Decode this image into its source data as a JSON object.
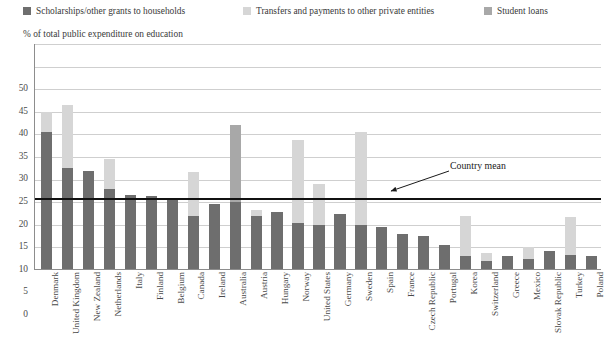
{
  "legend": {
    "items": [
      {
        "label": "Scholarships/other grants to households",
        "color": "#6e6e6e",
        "icon": "square-swatch-icon"
      },
      {
        "label": "Transfers and payments to other private entities",
        "color": "#d6d6d6",
        "icon": "square-swatch-icon"
      },
      {
        "label": "Student loans",
        "color": "#a8a8a8",
        "icon": "square-swatch-icon"
      }
    ]
  },
  "axis_title": "% of total public expenditure on education",
  "annotation": {
    "label": "Country mean",
    "value": 15.7
  },
  "chart_data": {
    "type": "bar",
    "title": "",
    "subtitle": "",
    "xlabel": "",
    "ylabel": "% of total public expenditure on education",
    "ylim": [
      0,
      50
    ],
    "yticks": [
      0,
      5,
      10,
      15,
      20,
      25,
      30,
      35,
      40,
      45,
      50
    ],
    "grid": true,
    "stacked": true,
    "legend_position": "top",
    "categories": [
      "Denmark",
      "United Kingdom",
      "New Zealand",
      "Netherlands",
      "Italy",
      "Finland",
      "Belgium",
      "Canada",
      "Ireland",
      "Australia",
      "Austria",
      "Hungary",
      "Norway",
      "United States",
      "Germany",
      "Sweden",
      "Spain",
      "France",
      "Czech Republic",
      "Portugal",
      "Korea",
      "Switzerland",
      "Greece",
      "Mexico",
      "Slovak Republic",
      "Turkey",
      "Poland"
    ],
    "series": [
      {
        "name": "Scholarships/other grants to households",
        "color": "#6e6e6e",
        "values": [
          30.5,
          22.5,
          22.0,
          18.0,
          16.5,
          16.3,
          16.0,
          12.0,
          14.7,
          15.0,
          12.0,
          12.8,
          10.5,
          10.0,
          12.3,
          10.0,
          9.5,
          8.0,
          7.5,
          5.5,
          3.0,
          2.0,
          3.2,
          2.5,
          4.2,
          3.3,
          3.0
        ]
      },
      {
        "name": "Student loans",
        "color": "#a8a8a8",
        "values": [
          0,
          0,
          0,
          0,
          0,
          0,
          0,
          0,
          0,
          17.0,
          0,
          0,
          0,
          0,
          0,
          0,
          0,
          0,
          0,
          0,
          0,
          0,
          0,
          0,
          0,
          0,
          0
        ]
      },
      {
        "name": "Transfers and payments to other private entities",
        "color": "#d6d6d6",
        "values": [
          4.5,
          14.0,
          0,
          6.5,
          0,
          0,
          0,
          9.7,
          0,
          0,
          1.3,
          0,
          18.3,
          9.0,
          0,
          20.5,
          0,
          0,
          0,
          0,
          9.0,
          1.8,
          0,
          2.7,
          0,
          8.4,
          0
        ]
      }
    ],
    "country_mean": 15.7,
    "totals": [
      35.0,
      36.5,
      22.0,
      24.5,
      16.5,
      16.3,
      16.0,
      21.7,
      14.7,
      32.0,
      13.3,
      12.8,
      28.8,
      19.0,
      12.3,
      30.5,
      9.5,
      8.0,
      7.5,
      5.5,
      12.0,
      3.8,
      3.2,
      5.2,
      4.2,
      11.7,
      3.0
    ]
  }
}
